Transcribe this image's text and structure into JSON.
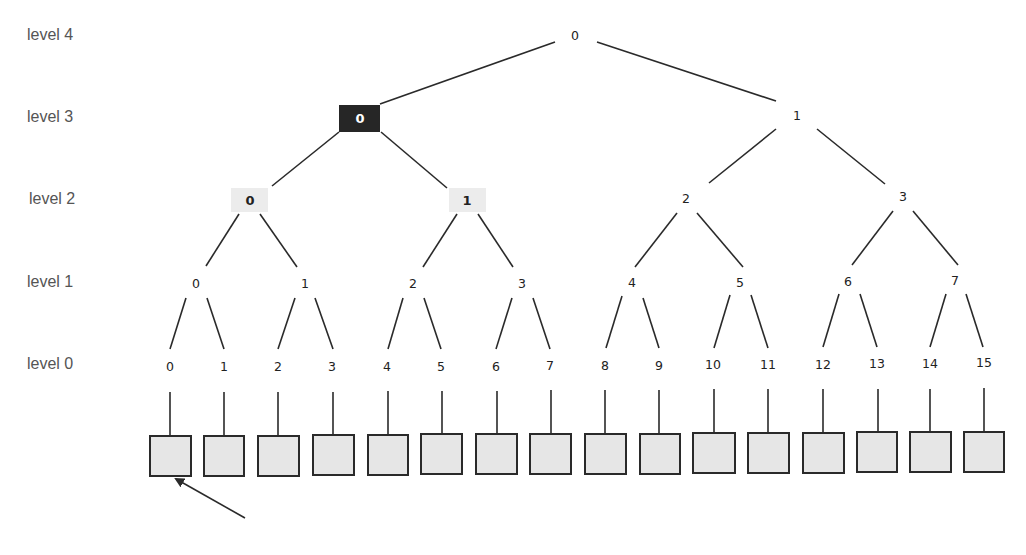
{
  "levels": [
    {
      "label": "level 4",
      "y": 40
    },
    {
      "label": "level 3",
      "y": 122
    },
    {
      "label": "level 2",
      "y": 204
    },
    {
      "label": "level 1",
      "y": 287
    },
    {
      "label": "level 0",
      "y": 369
    }
  ],
  "tree": {
    "level4": [
      {
        "label": "0",
        "x": 575,
        "y": 35
      }
    ],
    "level3": [
      {
        "label": "0",
        "x": 360,
        "y": 118,
        "highlight": "dark"
      },
      {
        "label": "1",
        "x": 797,
        "y": 115
      }
    ],
    "level2": [
      {
        "label": "0",
        "x": 250,
        "y": 200,
        "highlight": "light"
      },
      {
        "label": "1",
        "x": 467,
        "y": 200,
        "highlight": "light"
      },
      {
        "label": "2",
        "x": 686,
        "y": 198
      },
      {
        "label": "3",
        "x": 903,
        "y": 196
      }
    ],
    "level1": [
      {
        "label": "0",
        "x": 196,
        "y": 283
      },
      {
        "label": "1",
        "x": 305,
        "y": 283
      },
      {
        "label": "2",
        "x": 413,
        "y": 283
      },
      {
        "label": "3",
        "x": 522,
        "y": 283
      },
      {
        "label": "4",
        "x": 632,
        "y": 282
      },
      {
        "label": "5",
        "x": 740,
        "y": 282
      },
      {
        "label": "6",
        "x": 848,
        "y": 281
      },
      {
        "label": "7",
        "x": 955,
        "y": 280
      }
    ],
    "level0": [
      {
        "label": "0",
        "x": 170,
        "y": 366
      },
      {
        "label": "1",
        "x": 224,
        "y": 366
      },
      {
        "label": "2",
        "x": 278,
        "y": 366
      },
      {
        "label": "3",
        "x": 332,
        "y": 366
      },
      {
        "label": "4",
        "x": 387,
        "y": 366
      },
      {
        "label": "5",
        "x": 441,
        "y": 366
      },
      {
        "label": "6",
        "x": 496,
        "y": 366
      },
      {
        "label": "7",
        "x": 550,
        "y": 365
      },
      {
        "label": "8",
        "x": 605,
        "y": 365
      },
      {
        "label": "9",
        "x": 659,
        "y": 365
      },
      {
        "label": "10",
        "x": 713,
        "y": 364
      },
      {
        "label": "11",
        "x": 768,
        "y": 364
      },
      {
        "label": "12",
        "x": 823,
        "y": 364
      },
      {
        "label": "13",
        "x": 877,
        "y": 363
      },
      {
        "label": "14",
        "x": 930,
        "y": 363
      },
      {
        "label": "15",
        "x": 984,
        "y": 362
      }
    ]
  },
  "leaf_boxes": {
    "count": 16,
    "width": 40,
    "height": 40,
    "top": 435,
    "fill": "#e6e6e6",
    "stroke": "#2a2a2a"
  },
  "arrow": {
    "from": [
      245,
      518
    ],
    "to": [
      175,
      477
    ],
    "points_to": "leaf box 0"
  },
  "colors": {
    "highlight_dark": "#262626",
    "highlight_light": "#ececec",
    "line": "#2a2a2a",
    "label_text": "#555555"
  }
}
